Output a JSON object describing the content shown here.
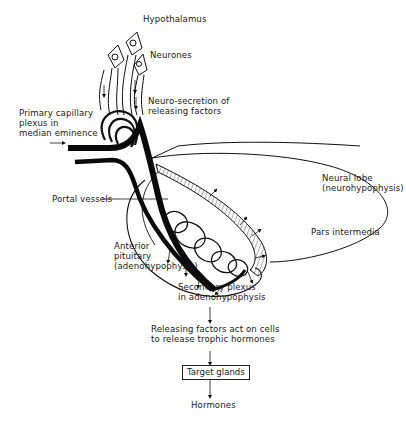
{
  "diagram": {
    "type": "anatomical-flow",
    "labels": {
      "hypothalamus": "Hypothalamus",
      "neurones": "Neurones",
      "neurosecretion_line1": "Neuro-secretion of",
      "neurosecretion_line2": "releasing factors",
      "primary_plexus_line1": "Primary capillary",
      "primary_plexus_line2": "plexus in",
      "primary_plexus_line3": "median eminence",
      "neural_lobe_line1": "Neural lobe",
      "neural_lobe_line2": "(neurohypophysis)",
      "portal_vessels": "Portal vessels",
      "pars_intermedia": "Pars intermedia",
      "anterior_line1": "Anterior",
      "anterior_line2": "pituitary",
      "anterior_line3": "(adenohypophysis)",
      "secondary_line1": "Secondary plexus",
      "secondary_line2": "in adenohypophysis"
    },
    "flow": {
      "step1_line1": "Releasing factors act on cells",
      "step1_line2": "to release trophic hormones",
      "target_glands": "Target glands",
      "hormones": "Hormones"
    }
  }
}
